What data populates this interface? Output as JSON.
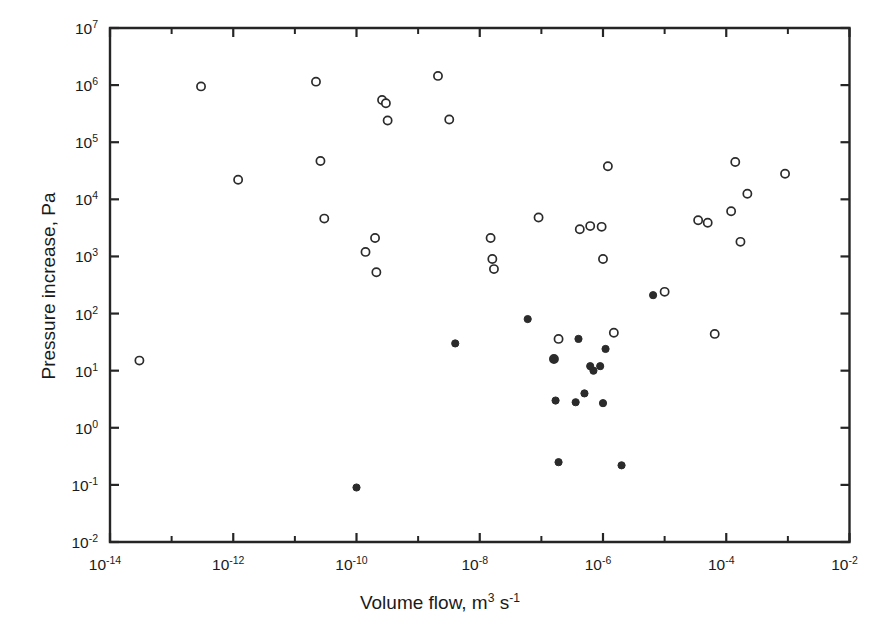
{
  "chart_data": {
    "type": "scatter",
    "title": "",
    "xlabel": "Volume flow, m^3 s^-1",
    "xlabel_parts": {
      "text_before": "Volume flow, m",
      "sup1": "3",
      "text_mid": " s",
      "sup2": "-1"
    },
    "ylabel": "Pressure increase, Pa",
    "xscale": "log",
    "yscale": "log",
    "xlim": [
      1e-14,
      0.01
    ],
    "ylim": [
      0.01,
      10000000.0
    ],
    "grid": false,
    "legend": "none",
    "xticklabels": [
      "10-14",
      "10-12",
      "10-10",
      "10-8",
      "10-6",
      "10-4",
      "10-2"
    ],
    "xtick_mantissa": "10",
    "xtick_exponents": [
      "-14",
      "-12",
      "-10",
      "-8",
      "-6",
      "-4",
      "-2"
    ],
    "xtick_exponents_all": [
      -14,
      -13,
      -12,
      -11,
      -10,
      -9,
      -8,
      -7,
      -6,
      -5,
      -4,
      -3,
      -2
    ],
    "ytick_exponents": [
      7,
      6,
      5,
      4,
      3,
      2,
      1,
      0,
      -1,
      -2
    ],
    "ytick_mantissa": "10",
    "series": [
      {
        "name": "open-circles",
        "marker": "open-circle",
        "color": "#2b2b2b",
        "points": [
          [
            3e-13,
            950000.0
          ],
          [
            1.2e-12,
            22000.0
          ],
          [
            2.2e-11,
            1150000.0
          ],
          [
            2.6e-11,
            47000.0
          ],
          [
            3e-11,
            4600.0
          ],
          [
            1.4e-10,
            1200.0
          ],
          [
            2e-10,
            2100.0
          ],
          [
            2.1e-10,
            530.0
          ],
          [
            2.6e-10,
            550000.0
          ],
          [
            3e-10,
            480000.0
          ],
          [
            3.2e-10,
            240000.0
          ],
          [
            2.1e-09,
            1450000.0
          ],
          [
            3.2e-09,
            250000.0
          ],
          [
            1.5e-08,
            2100.0
          ],
          [
            1.6e-08,
            900.0
          ],
          [
            1.7e-08,
            600.0
          ],
          [
            9e-08,
            4800.0
          ],
          [
            1.6e-07,
            16.0
          ],
          [
            1.9e-07,
            36.0
          ],
          [
            4.2e-07,
            3000.0
          ],
          [
            6.2e-07,
            3400.0
          ],
          [
            9.5e-07,
            3300.0
          ],
          [
            1e-06,
            900.0
          ],
          [
            1.2e-06,
            38000.0
          ],
          [
            1.5e-06,
            46.0
          ],
          [
            1e-05,
            240.0
          ],
          [
            3.5e-05,
            4300.0
          ],
          [
            5e-05,
            3900.0
          ],
          [
            6.5e-05,
            44.0
          ],
          [
            0.00012,
            6200.0
          ],
          [
            0.00014,
            45000.0
          ],
          [
            0.00017,
            1800.0
          ],
          [
            0.00022,
            12500.0
          ],
          [
            0.0009,
            28000.0
          ],
          [
            3e-14,
            15.0
          ]
        ]
      },
      {
        "name": "filled-circles",
        "marker": "filled-circle",
        "color": "#2b2b2b",
        "points": [
          [
            1e-10,
            0.09
          ],
          [
            4e-09,
            30.0
          ],
          [
            6e-08,
            80.0
          ],
          [
            4e-07,
            36.0
          ],
          [
            1.1e-06,
            24.0
          ],
          [
            1.6e-07,
            16.0
          ],
          [
            1.7e-07,
            3.0
          ],
          [
            3.6e-07,
            2.8
          ],
          [
            5e-07,
            4.0
          ],
          [
            6.2e-07,
            12.0
          ],
          [
            7e-07,
            10.0
          ],
          [
            1.9e-07,
            0.25
          ],
          [
            9e-07,
            12.0
          ],
          [
            2e-06,
            0.22
          ],
          [
            1e-06,
            2.7
          ],
          [
            6.5e-06,
            210.0
          ]
        ]
      }
    ],
    "annotations": []
  }
}
